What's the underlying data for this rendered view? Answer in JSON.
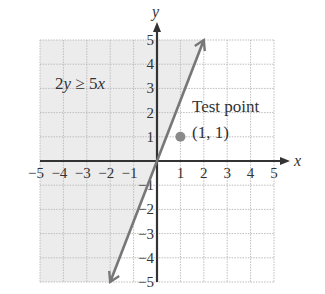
{
  "chart_data": {
    "type": "line",
    "title": "",
    "xlabel": "x",
    "ylabel": "y",
    "xlim": [
      -5,
      5
    ],
    "ylim": [
      -5,
      5
    ],
    "grid": true,
    "x_ticks": [
      "−5",
      "−4",
      "−3",
      "−2",
      "−1",
      "1",
      "2",
      "3",
      "4",
      "5"
    ],
    "y_ticks": [
      "5",
      "4",
      "3",
      "2",
      "1",
      "−1",
      "−2",
      "−3",
      "−4",
      "−5"
    ],
    "series": [
      {
        "name": "boundary line 2y = 5x",
        "x": [
          -2,
          2
        ],
        "y": [
          -5,
          5
        ],
        "style": "solid",
        "color": "#777777"
      }
    ],
    "shaded_region": {
      "inequality": "2y ≥ 5x",
      "side": "above/left of line",
      "color": "#ececec"
    },
    "points": [
      {
        "label": "Test point (1, 1)",
        "x": 1,
        "y": 1,
        "color": "#8a8a8a"
      }
    ],
    "annotations": {
      "inequality_label": "2y ≥ 5x",
      "test_point_line1": "Test point",
      "test_point_line2": "(1, 1)"
    }
  },
  "colors": {
    "axis": "#333333",
    "grid": "#bdbdbd",
    "shade": "#ececec",
    "line": "#777777",
    "point": "#8a8a8a"
  }
}
